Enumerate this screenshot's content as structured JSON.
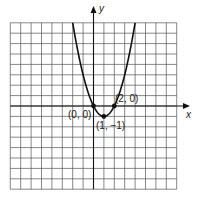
{
  "chart_data": {
    "type": "line",
    "title": "",
    "xlabel": "x",
    "ylabel": "y",
    "xlim": [
      -8,
      8
    ],
    "ylim": [
      -8,
      8
    ],
    "grid": true,
    "grid_step": 1,
    "series": [
      {
        "name": "y = x^2 - 2x",
        "function": "x^2 - 2x",
        "x": [
          -2,
          -1.5,
          -1,
          -0.5,
          0,
          0.5,
          1,
          1.5,
          2,
          2.5,
          3,
          3.5,
          4
        ],
        "values": [
          8,
          5.25,
          3,
          1.25,
          0,
          -0.75,
          -1,
          -0.75,
          0,
          1.25,
          3,
          5.25,
          8
        ]
      }
    ],
    "points": [
      {
        "x": 0,
        "y": 0,
        "label": "(0, 0)"
      },
      {
        "x": 2,
        "y": 0,
        "label": "(2, 0)"
      },
      {
        "x": 1,
        "y": -1,
        "label": "(1, −1)"
      }
    ],
    "annotations": [
      "(0, 0)",
      "(2, 0)",
      "(1, −1)"
    ]
  },
  "labels": {
    "x_axis": "x",
    "y_axis": "y",
    "p0": "(0, 0)",
    "p1": "(2, 0)",
    "p2": "(1, −1)"
  },
  "colors": {
    "grid": "#555555",
    "axis": "#111111",
    "curve": "#111111"
  }
}
